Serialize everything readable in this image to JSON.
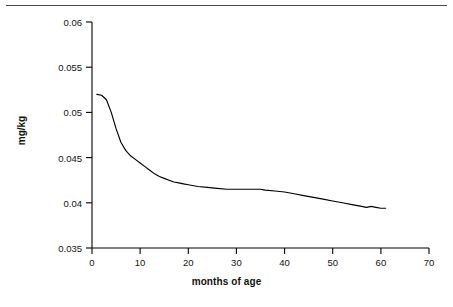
{
  "figure": {
    "background_color": "#ffffff",
    "rule_color": "#4a4a4a",
    "line_color": "#000000",
    "axis_color": "#000000"
  },
  "axis_titles": {
    "x": "months of age",
    "y": "mg/kg"
  },
  "ticks": {
    "x": [
      "0",
      "10",
      "20",
      "30",
      "40",
      "50",
      "60",
      "70"
    ],
    "y": [
      "0.035",
      "0.04",
      "0.045",
      "0.05",
      "0.055",
      "0.06"
    ]
  },
  "chart_data": {
    "type": "line",
    "title": "",
    "subtitle": "",
    "xlabel": "months of age",
    "ylabel": "mg/kg",
    "xlim": [
      0,
      70
    ],
    "ylim": [
      0.035,
      0.06
    ],
    "xticks": [
      0,
      10,
      20,
      30,
      40,
      50,
      60,
      70
    ],
    "yticks": [
      0.035,
      0.04,
      0.045,
      0.05,
      0.055,
      0.06
    ],
    "grid": false,
    "legend": null,
    "legend_position": "none",
    "annotations": [],
    "series": [
      {
        "name": "mg/kg by months of age",
        "color": "#000000",
        "x": [
          1,
          2,
          3,
          4,
          5,
          6,
          7,
          8,
          9,
          10,
          11,
          12,
          13,
          14,
          15,
          16,
          17,
          18,
          19,
          20,
          22,
          24,
          26,
          28,
          30,
          32,
          34,
          35,
          36,
          38,
          40,
          42,
          44,
          46,
          48,
          50,
          52,
          54,
          56,
          57,
          58,
          59,
          60,
          61
        ],
        "y": [
          0.052,
          0.0519,
          0.0514,
          0.05,
          0.0482,
          0.0467,
          0.0458,
          0.0452,
          0.0448,
          0.0444,
          0.044,
          0.0436,
          0.0432,
          0.0429,
          0.0427,
          0.0425,
          0.0423,
          0.0422,
          0.0421,
          0.042,
          0.0418,
          0.0417,
          0.0416,
          0.0415,
          0.0415,
          0.0415,
          0.0415,
          0.0415,
          0.0414,
          0.0413,
          0.0412,
          0.041,
          0.0408,
          0.0406,
          0.0404,
          0.0402,
          0.04,
          0.0398,
          0.0396,
          0.0395,
          0.0396,
          0.0395,
          0.0394,
          0.0394
        ]
      }
    ]
  }
}
